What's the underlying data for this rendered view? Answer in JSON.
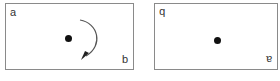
{
  "figure": {
    "panels": [
      {
        "id": "original",
        "top_left_label": "a",
        "bottom_right_label": "b",
        "center": "dot",
        "arrow": "clockwise-rotation-arrow"
      },
      {
        "id": "rotated-180",
        "top_left_label": "b",
        "bottom_right_label": "a",
        "labels_rotated_deg": 180,
        "center": "dot"
      }
    ],
    "colors": {
      "border": "#8a8a8a",
      "dot": "#111111",
      "arrow": "#555555",
      "text": "#333333"
    }
  }
}
